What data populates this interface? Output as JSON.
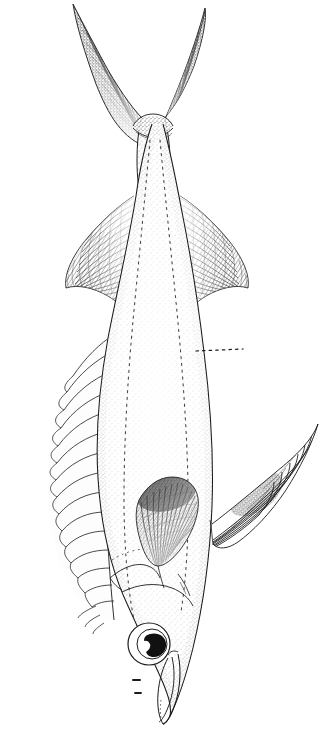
{
  "plate": {
    "title": "Fish species lateral-view line illustration",
    "subject": "bony fish (perciform), whole body, lateral view rotated to vertical",
    "medium": "ink stipple and line engraving",
    "orientation": "vertical, caudal fin at top, head at bottom",
    "background_color": "#ffffff",
    "ink_color": "#1b1b1b",
    "width_px": 327,
    "height_px": 737,
    "visible_text": "",
    "caption": ""
  },
  "anatomy": {
    "caudal_fin": {
      "label": "caudal fin",
      "shape": "deeply forked, two long pointed lobes forming a narrow V",
      "shading": "dense dark stipple along distal halves of both lobes",
      "ray_count_upper": 12,
      "ray_count_lower": 13,
      "upper_lobe_tip": [
        73,
        4
      ],
      "lower_lobe_tip": [
        205,
        8
      ],
      "fork_notch": [
        152,
        92
      ]
    },
    "caudal_peduncle": {
      "label": "caudal peduncle",
      "shape": "slender, narrow, with small lateral keel at fin base",
      "keel_present": true,
      "top_y": 120,
      "bottom_y": 200
    },
    "second_dorsal_fin": {
      "label": "second dorsal fin",
      "side_in_image": "right",
      "shape": "falcate, swept back, soft rays with fine cross-hatching",
      "ray_count": 22,
      "shading": "medium hatch, darker along distal margin",
      "origin": [
        178,
        300
      ],
      "tip": [
        248,
        270
      ]
    },
    "anal_fin": {
      "label": "anal fin",
      "side_in_image": "left",
      "shape": "falcate, mirrors second dorsal, soft rays with cross-hatching",
      "ray_count": 21,
      "shading": "medium hatch, darker along distal margin",
      "origin": [
        104,
        300
      ],
      "tip": [
        36,
        268
      ]
    },
    "first_dorsal_fin": {
      "label": "first dorsal fin",
      "side_in_image": "left",
      "shape": "long, low, spinous; membrane scalloped between spines",
      "spine_count": 14,
      "shading": "light, thin outline only",
      "origin_y": 612,
      "terminus_y": 330
    },
    "pectoral_fin": {
      "label": "pectoral fin",
      "shape": "short, broad, rounded-falcate paddle",
      "shading": "darkest element of the plate; heavy stipple at base grading to fine rays",
      "ray_count": 18,
      "center": [
        168,
        512
      ]
    },
    "pelvic_fin": {
      "label": "pelvic fin",
      "side_in_image": "right",
      "shape": "elongate, projecting outward and upward, rays splayed",
      "ray_count": 7,
      "shading": "dark stipple mid-fin, fine outline rays",
      "base": [
        215,
        520
      ],
      "tip": [
        318,
        424
      ]
    },
    "head": {
      "label": "head",
      "shape": "bluntly pointed snout, terminal mouth",
      "operculum_lines": 3,
      "nostril_count": 2
    },
    "eye": {
      "label": "eye",
      "shape": "large round eye, circular orbit ring, round iris, irregular dark pupil",
      "center": [
        149,
        644
      ],
      "orbit_radius": 20,
      "iris_radius": 14,
      "pupil_color": "#111111"
    },
    "mouth": {
      "label": "mouth",
      "shape": "narrow elongate jaw, lips outlined, slightly open",
      "lower_jaw_tip": [
        166,
        716
      ]
    },
    "body": {
      "label": "body",
      "shape": "deep, laterally compressed, ovate, widest below mid-length",
      "surface": "uniform fine stipple, denser along margins"
    },
    "lateral_lines": {
      "label": "lateral line and body contour lines",
      "style": "dotted",
      "count": 2
    }
  },
  "annotations": {
    "leader_line": {
      "name": "leader-line",
      "style": "horizontal dotted leader, no text label",
      "from": [
        196,
        351
      ],
      "to": [
        243,
        349
      ],
      "dot_count": 9,
      "text": ""
    }
  }
}
